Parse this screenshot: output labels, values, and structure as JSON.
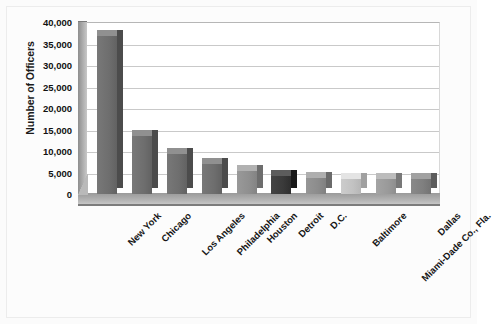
{
  "chart_data": {
    "type": "bar",
    "title": "",
    "subtitle": "",
    "xlabel": "",
    "ylabel": "Number of Officers",
    "ylim": [
      0,
      40000
    ],
    "ytick_step": 5000,
    "ytick_labels": [
      "40,000",
      "35,000",
      "30,000",
      "25,000",
      "20,000",
      "15,000",
      "10,000",
      "5,000",
      "0"
    ],
    "ytick_values": [
      40000,
      35000,
      30000,
      25000,
      20000,
      15000,
      10000,
      5000,
      0
    ],
    "grid": true,
    "legend": false,
    "legend_position": "none",
    "style": "3d-column",
    "categories": [
      "New York",
      "Chicago",
      "Los Angeles",
      "Philadelphia",
      "Houston",
      "Detroit",
      "D.C.",
      "Baltimore",
      "Miami-Dade Co., Fla.",
      "Dallas"
    ],
    "values": [
      36800,
      13500,
      9300,
      7000,
      5400,
      4100,
      3700,
      3500,
      3500,
      3400
    ],
    "bar_colors": [
      "#6e6e6e",
      "#6e6e6e",
      "#6e6e6e",
      "#6e6e6e",
      "#8f8f8f",
      "#3a3a3a",
      "#8c8c8c",
      "#c2c2c2",
      "#9a9a9a",
      "#7f7f7f"
    ]
  },
  "axis": {
    "y_title": "Number of Officers"
  },
  "colors": {
    "background": "#fbfbfb",
    "plot_background": "#ffffff",
    "gridline": "#c9c9c9",
    "axis_text": "#111111",
    "floor": "#b4b4b4",
    "sidewall": "#a8a8a8"
  }
}
